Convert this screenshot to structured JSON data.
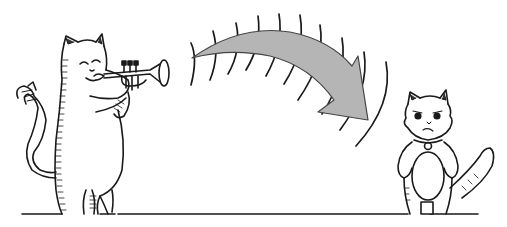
{
  "illustration": {
    "subject": "Cat playing trumpet toward an unimpressed small cat",
    "colors": {
      "background": "#ffffff",
      "ink": "#1a1a1a",
      "arrow_fill": "#b5b5b5",
      "arrow_stroke": "#444444"
    },
    "elements": {
      "trumpet_cat": "trumpet-playing-cat",
      "trumpet": "trumpet",
      "sound_waves": 12,
      "arrow": "curved-arrow",
      "listener_cat": "annoyed-small-cat",
      "ground": "ground-line"
    }
  }
}
